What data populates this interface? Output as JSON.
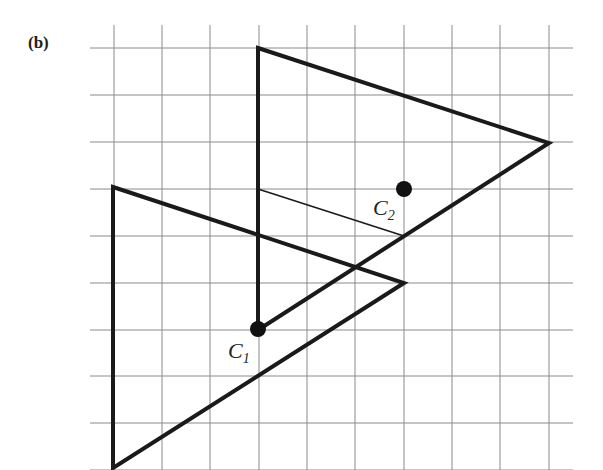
{
  "figure": {
    "panel_label": "(b)",
    "grid": {
      "x_lines": [
        114,
        162,
        210,
        259,
        307,
        355,
        404,
        452,
        500,
        549
      ],
      "y_lines": [
        48,
        95,
        142,
        189,
        236,
        283,
        330,
        376,
        423,
        470
      ],
      "x_start": 90,
      "x_end": 573,
      "y_start": 25,
      "y_end": 470,
      "color": "#8a8a8a"
    },
    "shapes": {
      "triangle_1": {
        "points": "258,48 549,143 258,330",
        "color": "#1a1a1a"
      },
      "triangle_2": {
        "points": "113,187 404,283 113,468",
        "color": "#1a1a1a"
      },
      "median_line": {
        "x1": 258,
        "y1": 189,
        "x2": 404,
        "y2": 236
      }
    },
    "points": [
      {
        "name": "C",
        "subscript": "1",
        "x": 258,
        "y": 329,
        "label_x": 228,
        "label_y": 358
      },
      {
        "name": "C",
        "subscript": "2",
        "x": 404,
        "y": 189,
        "label_x": 373,
        "label_y": 215
      }
    ]
  }
}
